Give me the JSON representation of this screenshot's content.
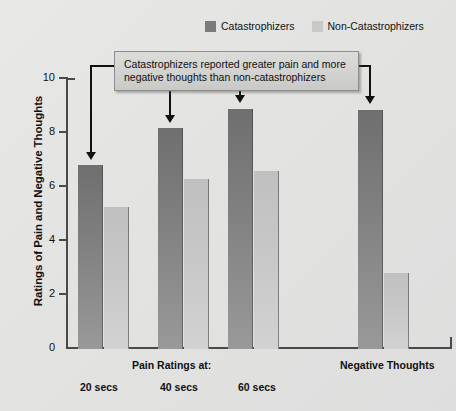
{
  "chart_data": {
    "type": "bar",
    "title": "",
    "xlabel": "",
    "ylabel": "Ratings of Pain and Negative Thoughts",
    "ylim": [
      0,
      10
    ],
    "yticks": [
      0,
      2,
      4,
      6,
      8,
      10
    ],
    "grid": false,
    "legend_position": "top-right",
    "categories": [
      "20 secs",
      "40 secs",
      "60 secs",
      "Negative Thoughts"
    ],
    "series": [
      {
        "name": "Catastrophizers",
        "color": "#7b7b7b",
        "values": [
          6.8,
          8.2,
          8.9,
          8.85
        ]
      },
      {
        "name": "Non-Catastrophizers",
        "color": "#c8c8c8",
        "values": [
          5.25,
          6.3,
          6.6,
          2.8
        ]
      }
    ],
    "annotations": [
      "Catastrophizers reported greater pain and more negative thoughts than non-catastrophizers"
    ]
  },
  "legend": {
    "items": [
      {
        "label": "Catastrophizers",
        "swatch": "dark"
      },
      {
        "label": "Non-Catastrophizers",
        "swatch": "light"
      }
    ]
  },
  "callout": {
    "line1": "Catastrophizers reported greater pain and more",
    "line2": "negative thoughts than non-catastrophizers"
  },
  "axes": {
    "y_title": "Ratings of Pain and Negative Thoughts",
    "y_ticks": [
      "10",
      "8",
      "6",
      "4",
      "2",
      "0"
    ]
  },
  "x_labels": {
    "pain_group": "Pain Ratings at:",
    "negative_group": "Negative Thoughts",
    "t20": "20 secs",
    "t40": "40 secs",
    "t60": "60 secs"
  },
  "colors": {
    "catastrophizers": "#7b7b7b",
    "non_catastrophizers": "#c8c8c8",
    "axis": "#4a4a4a",
    "background": "#e3e3e1"
  }
}
